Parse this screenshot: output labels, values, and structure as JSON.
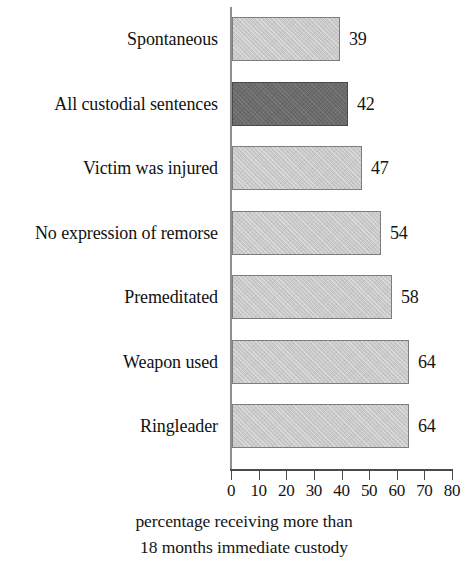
{
  "chart_data": {
    "type": "bar",
    "orientation": "horizontal",
    "title": "",
    "xlabel": "percentage receiving more than 18 months immediate custody",
    "ylabel": "",
    "xlim": [
      0,
      80
    ],
    "xticks": [
      0,
      10,
      20,
      30,
      40,
      50,
      60,
      70,
      80
    ],
    "grid": false,
    "legend": false,
    "categories": [
      "Spontaneous",
      "All custodial sentences",
      "Victim was injured",
      "No expression of remorse",
      "Premeditated",
      "Weapon used",
      "Ringleader"
    ],
    "values": [
      39,
      42,
      47,
      54,
      58,
      64,
      64
    ],
    "value_labels": [
      "39",
      "42",
      "47",
      "54",
      "58",
      "64",
      "64"
    ],
    "highlighted_index": 1,
    "colors": {
      "bar": "#c9c9c9",
      "bar_highlight": "#6b6b6b",
      "bar_border": "#7d7d7d",
      "axis": "#4a4a4a",
      "text": "#141414",
      "background": "#ffffff"
    }
  },
  "caption": {
    "line1": "percentage receiving more than",
    "line2": "18 months immediate custody"
  },
  "axis": {
    "tick_labels": [
      "0",
      "10",
      "20",
      "30",
      "40",
      "50",
      "60",
      "70",
      "80"
    ]
  }
}
